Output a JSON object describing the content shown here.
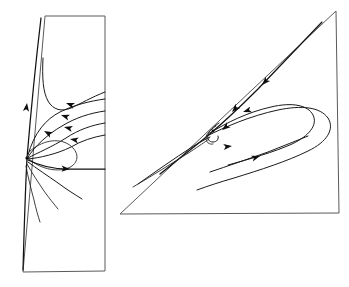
{
  "figure": {
    "title": "Phase portraits of a planar vector field",
    "width": 349,
    "height": 287,
    "background_color": "#ffffff",
    "boundary_color": "#5a5a5a",
    "trajectory_color": "#1a1a1a",
    "arrow_color": "#0d0d0d",
    "panel_count": 2
  },
  "panels": [
    {
      "id": "left-panel",
      "name": "saddle-panel",
      "shape": "quadrilateral",
      "label": "",
      "boundary_points": [
        [
          45,
          16
        ],
        [
          105,
          16
        ],
        [
          105,
          271
        ],
        [
          23,
          272
        ]
      ],
      "equilibria": [
        {
          "name": "saddle-point",
          "type": "saddle",
          "x": 27,
          "y": 158
        }
      ],
      "arrows": [
        {
          "x": 27,
          "y": 103,
          "angle": -83,
          "direction": "up"
        },
        {
          "x": 66,
          "y": 103,
          "angle": 200,
          "direction": "left"
        },
        {
          "x": 61,
          "y": 114,
          "angle": 198,
          "direction": "left"
        },
        {
          "x": 64,
          "y": 126,
          "angle": 193,
          "direction": "left"
        },
        {
          "x": 69,
          "y": 138,
          "angle": 190,
          "direction": "left"
        },
        {
          "x": 43,
          "y": 131,
          "angle": 205,
          "direction": "left"
        },
        {
          "x": 67,
          "y": 168,
          "angle": 2,
          "direction": "right"
        }
      ]
    },
    {
      "id": "right-panel",
      "name": "spiral-panel",
      "shape": "triangle-with-vertical-edge",
      "label": "",
      "boundary_points": [
        [
          336,
          11
        ],
        [
          339,
          213
        ],
        [
          120,
          214
        ]
      ],
      "equilibria": [
        {
          "name": "spiral-focus",
          "type": "focus",
          "x": 213,
          "y": 131
        }
      ],
      "arrows": [
        {
          "x": 262,
          "y": 78,
          "angle": 131,
          "direction": "down-left"
        },
        {
          "x": 232,
          "y": 109,
          "angle": 131,
          "direction": "down-left"
        },
        {
          "x": 221,
          "y": 133,
          "angle": 140,
          "direction": "down-left"
        },
        {
          "x": 240,
          "y": 110,
          "angle": 160,
          "direction": "left"
        },
        {
          "x": 226,
          "y": 127,
          "angle": 352,
          "direction": "right"
        },
        {
          "x": 258,
          "y": 155,
          "angle": 340,
          "direction": "up-right"
        }
      ]
    }
  ],
  "legend": {
    "items": [
      {
        "symbol": "arrow",
        "label": "flow direction"
      },
      {
        "symbol": "curve",
        "label": "trajectory"
      },
      {
        "symbol": "line",
        "label": "region boundary"
      }
    ]
  }
}
